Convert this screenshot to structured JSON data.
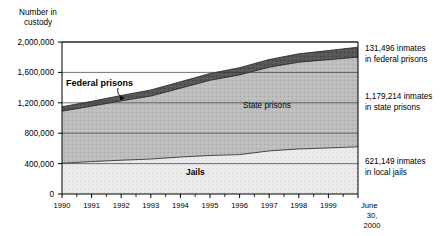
{
  "chart_data": {
    "type": "area",
    "stacked": true,
    "title": "",
    "ylabel": "Number in\ncustody",
    "ylabel_line1": "Number in",
    "ylabel_line2": "custody",
    "xlabel": "",
    "ylim": [
      0,
      2000000
    ],
    "ytick_values": [
      0,
      400000,
      800000,
      1200000,
      1600000,
      2000000
    ],
    "ytick_labels": [
      "0",
      "400,000",
      "800,000",
      "1,200,000",
      "1,600,000",
      "2,000,000"
    ],
    "grid": "horizontal",
    "legend_position": "inline-annotations",
    "x": [
      1990,
      1991,
      1992,
      1993,
      1994,
      1995,
      1996,
      1997,
      1998,
      1999,
      2000.5
    ],
    "xtick_labels": [
      "1990",
      "1991",
      "1992",
      "1993",
      "1994",
      "1995",
      "1996",
      "1997",
      "1998",
      "1999",
      "June\n30,\n2000"
    ],
    "xtick_minor": true,
    "xaxis_end_label_line1": "June",
    "xaxis_end_label_line2": "30,",
    "xaxis_end_label_line3": "2000",
    "series": [
      {
        "name": "Jails",
        "label": "Jails",
        "values": [
          405320,
          426479,
          444584,
          459804,
          486474,
          507044,
          518492,
          567079,
          592462,
          605943,
          621149
        ]
      },
      {
        "name": "State prisons",
        "label": "State prisons",
        "values": [
          684544,
          728605,
          780357,
          828566,
          904647,
          989004,
          1048900,
          1100850,
          1141700,
          1161490,
          1179214
        ]
      },
      {
        "name": "Federal prisons",
        "label": "Federal prisons",
        "values": [
          58838,
          63930,
          72071,
          80815,
          85500,
          89538,
          95088,
          101755,
          110793,
          120000,
          131496
        ]
      }
    ],
    "annotations": [
      {
        "line1": "131,496 inmates",
        "line2": "in federal prisons",
        "value": 131496,
        "series": "Federal prisons"
      },
      {
        "line1": "1,179,214 inmates",
        "line2": "in state prisons",
        "value": 1179214,
        "series": "State prisons"
      },
      {
        "line1": "621,149 inmates",
        "line2": "in local jails",
        "value": 621149,
        "series": "Jails"
      }
    ],
    "colors": {
      "jails": "#e3e3e3",
      "state_prisons": "#b8b8b8",
      "federal_prisons": "#5a5a5a",
      "axis": "#000000",
      "grid": "#3a3a3a"
    }
  }
}
